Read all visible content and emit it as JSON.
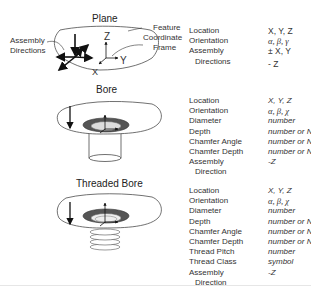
{
  "features": [
    {
      "title": "Plane",
      "callouts": {
        "assembly_directions": [
          "Assembly",
          "Directions"
        ],
        "feature_frame": [
          "Feature",
          "Coordinate",
          "Frame"
        ],
        "axes": {
          "x": "X",
          "y": "Y",
          "z": "Z"
        }
      },
      "properties": [
        {
          "name": "Location",
          "value": "X, Y, Z"
        },
        {
          "name": "Orientation",
          "value": "α, β, γ"
        },
        {
          "name": "Assembly",
          "value": "± X, Y"
        },
        {
          "name": "Directions",
          "value": "- Z"
        }
      ]
    },
    {
      "title": "Bore",
      "properties": [
        {
          "name": "Location",
          "value": "X, Y, Z"
        },
        {
          "name": "Orientation",
          "value": "α, β, χ"
        },
        {
          "name": "Diameter",
          "value": "number"
        },
        {
          "name": "Depth",
          "value": "number or NIL"
        },
        {
          "name": "Chamfer Angle",
          "value": "number or NIL"
        },
        {
          "name": "Chamfer Depth",
          "value": "number or NIL"
        },
        {
          "name": "Assembly",
          "value": "-Z"
        },
        {
          "name": "Direction",
          "value": ""
        }
      ]
    },
    {
      "title": "Threaded Bore",
      "properties": [
        {
          "name": "Location",
          "value": "X, Y, Z"
        },
        {
          "name": "Orientation",
          "value": "α, β, χ"
        },
        {
          "name": "Diameter",
          "value": "number"
        },
        {
          "name": "Depth",
          "value": "number or NIL"
        },
        {
          "name": "Chamfer Angle",
          "value": "number or NIL"
        },
        {
          "name": "Chamfer Depth",
          "value": "number or NIL"
        },
        {
          "name": "Thread Pitch",
          "value": "number"
        },
        {
          "name": "Thread Class",
          "value": "symbol"
        },
        {
          "name": "Assembly",
          "value": "-Z"
        },
        {
          "name": "Direction",
          "value": ""
        }
      ]
    }
  ]
}
